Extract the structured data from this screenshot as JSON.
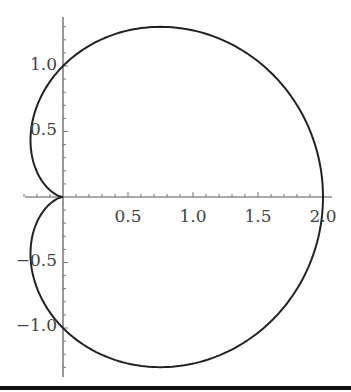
{
  "chart_data": {
    "type": "line",
    "title": "",
    "xlabel": "",
    "ylabel": "",
    "series": [
      {
        "name": "cardioid",
        "equation": "r = 1 + cos(theta)",
        "x": [
          2.0,
          1.93,
          1.75,
          1.47,
          1.12,
          0.75,
          0.4,
          0.12,
          -0.07,
          -0.19,
          -0.25,
          -0.25,
          -0.21,
          -0.14,
          -0.07,
          -0.02,
          0.0,
          -0.02,
          -0.07,
          -0.14,
          -0.21,
          -0.25,
          -0.25,
          -0.19,
          -0.07,
          0.12,
          0.4,
          0.75,
          1.12,
          1.47,
          1.75,
          1.93,
          2.0
        ],
        "y": [
          0.0,
          0.51,
          1.01,
          1.43,
          1.23,
          1.3,
          1.24,
          1.09,
          0.88,
          0.64,
          0.43,
          0.25,
          0.12,
          0.04,
          0.01,
          0.0,
          0.0,
          0.0,
          -0.01,
          -0.04,
          -0.12,
          -0.25,
          -0.43,
          -0.64,
          -0.88,
          -1.09,
          -1.24,
          -1.3,
          -1.23,
          -1.03,
          -0.7,
          -0.36,
          0.0
        ],
        "color": "#222222"
      }
    ],
    "xlim": [
      -0.3,
      2.05
    ],
    "ylim": [
      -1.35,
      1.35
    ],
    "xticks": [
      0.5,
      1.0,
      1.5,
      2.0
    ],
    "xtick_labels": [
      "0.5",
      "1.0",
      "1.5",
      "2.0"
    ],
    "yticks": [
      -1.0,
      -0.5,
      0.5,
      1.0
    ],
    "ytick_labels": [
      "−1.0",
      "−0.5",
      "0.5",
      "1.0"
    ],
    "grid": false,
    "legend": null
  },
  "axes": {
    "x_labels": [
      "0.5",
      "1.0",
      "1.5",
      "2.0"
    ],
    "y_labels": [
      "1.0",
      "0.5",
      "−0.5",
      "−1.0"
    ]
  }
}
